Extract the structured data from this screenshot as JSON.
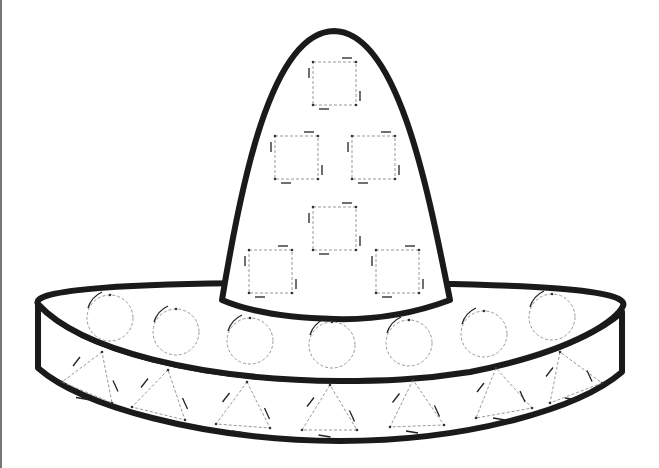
{
  "worksheet": {
    "subject": "sombrero tracing worksheet",
    "colors": {
      "outline": "#1a1a1a",
      "trace": "#999999",
      "background": "#ffffff"
    },
    "squares": [
      {
        "x": 313,
        "y": 62,
        "size": 43
      },
      {
        "x": 275,
        "y": 136,
        "size": 43
      },
      {
        "x": 352,
        "y": 136,
        "size": 43
      },
      {
        "x": 313,
        "y": 207,
        "size": 43
      },
      {
        "x": 249,
        "y": 250,
        "size": 43
      },
      {
        "x": 376,
        "y": 250,
        "size": 43
      }
    ],
    "circles": [
      {
        "cx": 110,
        "cy": 318,
        "r": 23
      },
      {
        "cx": 176,
        "cy": 332,
        "r": 23
      },
      {
        "cx": 250,
        "cy": 341,
        "r": 23
      },
      {
        "cx": 332,
        "cy": 345,
        "r": 23
      },
      {
        "cx": 409,
        "cy": 343,
        "r": 23
      },
      {
        "cx": 484,
        "cy": 334,
        "r": 23
      },
      {
        "cx": 552,
        "cy": 317,
        "r": 23
      }
    ],
    "triangles": [
      {
        "apex": [
          102,
          352
        ],
        "left": [
          62,
          382
        ],
        "right": [
          112,
          403
        ]
      },
      {
        "apex": [
          168,
          370
        ],
        "left": [
          132,
          407
        ],
        "right": [
          185,
          420
        ]
      },
      {
        "apex": [
          247,
          382
        ],
        "left": [
          216,
          424
        ],
        "right": [
          270,
          428
        ]
      },
      {
        "apex": [
          330,
          385
        ],
        "left": [
          302,
          430
        ],
        "right": [
          357,
          430
        ]
      },
      {
        "apex": [
          413,
          380
        ],
        "left": [
          390,
          427
        ],
        "right": [
          444,
          425
        ]
      },
      {
        "apex": [
          496,
          368
        ],
        "left": [
          476,
          418
        ],
        "right": [
          532,
          408
        ]
      },
      {
        "apex": [
          560,
          352
        ],
        "left": [
          550,
          403
        ],
        "right": [
          602,
          383
        ]
      }
    ]
  }
}
